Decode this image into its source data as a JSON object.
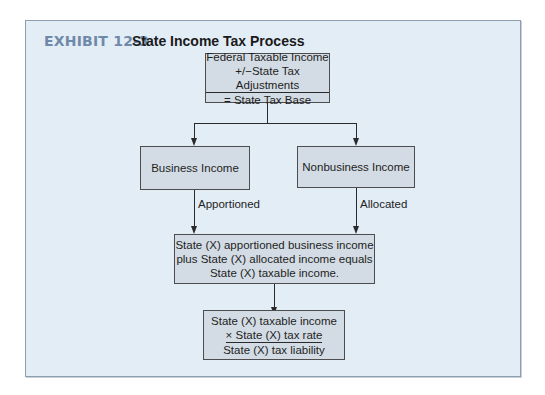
{
  "exhibit": {
    "label": "EXHIBIT 12-3",
    "title": "State Income Tax Process"
  },
  "colors": {
    "panel_bg": "#e3edf6",
    "box_bg": "#d3dce4",
    "label_accent": "#6f89a9"
  },
  "nodes": {
    "tax_base": {
      "line1": "Federal Taxable Income",
      "line2": "+/−State Tax Adjustments",
      "line3": "= State Tax Base"
    },
    "business": {
      "label": "Business Income"
    },
    "nonbusiness": {
      "label": "Nonbusiness Income"
    },
    "taxable": {
      "line1": "State (X) apportioned business income",
      "line2": "plus State (X) allocated income equals",
      "line3": "State (X) taxable income."
    },
    "liability": {
      "line1": "State (X) taxable income",
      "line2": "× State (X) tax rate",
      "line3": "State (X) tax liability"
    }
  },
  "edges": {
    "apportioned": "Apportioned",
    "allocated": "Allocated"
  }
}
